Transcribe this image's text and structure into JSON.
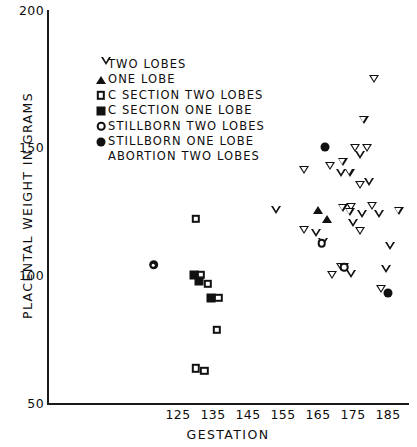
{
  "chart_data": {
    "type": "scatter",
    "title": "",
    "xlabel": "GESTATION",
    "ylabel": "PLACENTAL WEIGHT IN GRAMS",
    "xlim": [
      103,
      193
    ],
    "ylim": [
      50,
      200
    ],
    "xticks": [
      125,
      135,
      145,
      155,
      165,
      175,
      185
    ],
    "xtick_labels": [
      "125",
      "135",
      "145",
      "155",
      "165",
      "175",
      "185"
    ],
    "yticks": [
      50,
      100,
      150,
      200
    ],
    "ytick_labels": [
      "50",
      "100",
      "150",
      "200"
    ],
    "grid": false,
    "legend_position": "upper left inside",
    "axis_color": "#111111",
    "marker_color": "#111111",
    "background_color": "#ffffff",
    "series": [
      {
        "name": "TWO LOBES",
        "marker": "triangle-down-open",
        "points": [
          [
            181.0,
            176.5
          ],
          [
            178.0,
            160.5
          ],
          [
            175.5,
            149.5
          ],
          [
            179.0,
            149.5
          ],
          [
            177.0,
            147.0
          ],
          [
            172.0,
            144.0
          ],
          [
            168.5,
            142.5
          ],
          [
            171.5,
            140.0
          ],
          [
            174.0,
            140.0
          ],
          [
            161.0,
            141.0
          ],
          [
            177.0,
            135.0
          ],
          [
            179.5,
            136.5
          ],
          [
            153.0,
            125.5
          ],
          [
            172.0,
            126.0
          ],
          [
            174.5,
            126.5
          ],
          [
            174.0,
            124.5
          ],
          [
            180.5,
            127.0
          ],
          [
            177.5,
            124.0
          ],
          [
            182.5,
            124.0
          ],
          [
            188.0,
            125.0
          ],
          [
            175.0,
            120.5
          ],
          [
            177.0,
            117.0
          ],
          [
            161.0,
            117.5
          ],
          [
            164.5,
            116.5
          ],
          [
            166.5,
            113.0
          ],
          [
            185.5,
            111.5
          ],
          [
            171.5,
            103.0
          ],
          [
            172.5,
            103.0
          ],
          [
            184.5,
            102.5
          ],
          [
            169.0,
            100.0
          ],
          [
            174.5,
            100.5
          ],
          [
            183.0,
            94.5
          ]
        ]
      },
      {
        "name": "ONE LOBE",
        "marker": "triangle-up-filled",
        "points": [
          [
            165.0,
            125.5
          ],
          [
            167.5,
            122.0
          ]
        ]
      },
      {
        "name": "C SECTION TWO LOBES",
        "marker": "square-open",
        "points": [
          [
            130.0,
            122.0
          ],
          [
            131.5,
            100.0
          ],
          [
            133.5,
            96.5
          ],
          [
            136.5,
            91.0
          ],
          [
            136.0,
            78.5
          ],
          [
            130.0,
            63.5
          ],
          [
            132.5,
            62.5
          ]
        ]
      },
      {
        "name": "C SECTION ONE LOBE",
        "marker": "square-filled",
        "points": [
          [
            129.5,
            100.0
          ],
          [
            131.0,
            97.5
          ],
          [
            134.5,
            91.0
          ]
        ]
      },
      {
        "name": "STILLBORN TWO LOBES",
        "marker": "circle-open",
        "points": [
          [
            166.0,
            112.5
          ],
          [
            172.5,
            103.0
          ]
        ]
      },
      {
        "name": "STILLBORN ONE LOBE",
        "marker": "circle-filled",
        "points": [
          [
            167.0,
            150.0
          ],
          [
            185.0,
            93.0
          ]
        ]
      },
      {
        "name": "ABORTION TWO LOBES",
        "marker": "circle-dot",
        "points": [
          [
            118.0,
            104.0
          ]
        ]
      }
    ]
  },
  "axes": {
    "x_title": "GESTATION",
    "y_title": "PLACENTAL WEIGHT IN GRAMS",
    "x_tick_labels": [
      "125",
      "135",
      "145",
      "155",
      "165",
      "175",
      "185"
    ],
    "y_tick_labels": [
      "200",
      "150",
      "100",
      "50"
    ]
  },
  "legend": {
    "entries": [
      {
        "label": "TWO LOBES",
        "marker": "triangle-down-open"
      },
      {
        "label": "ONE LOBE",
        "marker": "triangle-up-filled"
      },
      {
        "label": "C SECTION TWO LOBES",
        "marker": "square-open"
      },
      {
        "label": "C SECTION ONE LOBE",
        "marker": "square-filled"
      },
      {
        "label": "STILLBORN TWO LOBES",
        "marker": "circle-open"
      },
      {
        "label": "STILLBORN ONE LOBE",
        "marker": "circle-filled"
      },
      {
        "label": "ABORTION TWO LOBES",
        "marker": "circle-dot"
      }
    ]
  }
}
